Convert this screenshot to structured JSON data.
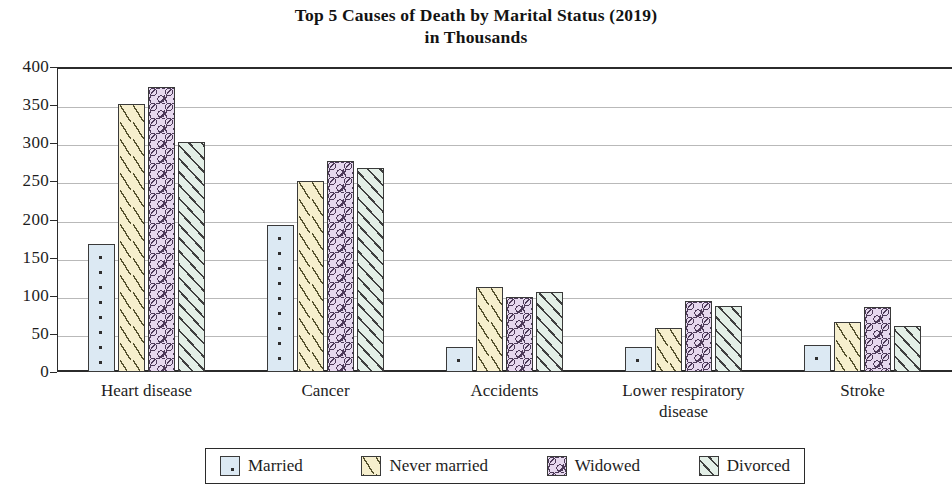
{
  "chart_data": {
    "type": "bar",
    "title": "Top 5 Causes of Death by Marital Status (2019)",
    "subtitle": "in Thousands",
    "xlabel": "",
    "ylabel": "",
    "ylim": [
      0,
      400
    ],
    "ytick_step": 50,
    "grid": true,
    "legend_position": "bottom",
    "categories": [
      "Heart disease",
      "Cancer",
      "Accidents",
      "Lower respiratory\ndisease",
      "Stroke"
    ],
    "ytick_labels": [
      "0",
      "50",
      "100",
      "150",
      "200",
      "250",
      "300",
      "350",
      "400"
    ],
    "ytick_values": [
      0,
      50,
      100,
      150,
      200,
      250,
      300,
      350,
      400
    ],
    "series": [
      {
        "name": "Married",
        "color": "#dce9f3",
        "pattern": "dots",
        "values": [
          168,
          193,
          33,
          33,
          35
        ]
      },
      {
        "name": "Never married",
        "color": "#f6efce",
        "pattern": "dashes",
        "values": [
          351,
          250,
          112,
          58,
          65
        ]
      },
      {
        "name": "Widowed",
        "color": "#e6d8ee",
        "pattern": "squiggles",
        "values": [
          374,
          277,
          98,
          93,
          85
        ]
      },
      {
        "name": "Divorced",
        "color": "#e3efe7",
        "pattern": "diagonal-hatch",
        "values": [
          302,
          267,
          105,
          87,
          60
        ]
      }
    ]
  }
}
